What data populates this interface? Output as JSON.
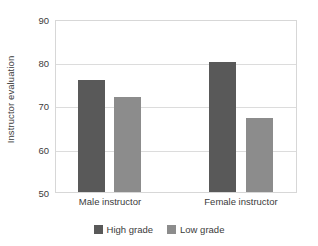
{
  "chart_data": {
    "type": "bar",
    "title": "",
    "xlabel": "",
    "ylabel": "Instructor evaluation",
    "categories": [
      "Male instructor",
      "Female instructor"
    ],
    "series": [
      {
        "name": "High grade",
        "values": [
          76,
          80
        ],
        "color": "#595959"
      },
      {
        "name": "Low grade",
        "values": [
          72,
          67
        ],
        "color": "#8c8c8c"
      }
    ],
    "ylim": [
      50,
      90
    ],
    "yticks": [
      50,
      60,
      70,
      80,
      90
    ],
    "ytick_labels": [
      "50",
      "60",
      "70",
      "80",
      "90"
    ],
    "grid": true,
    "legend_position": "bottom"
  },
  "axis": {
    "y_title": "Instructor evaluation",
    "tick_90": "90",
    "tick_80": "80",
    "tick_70": "70",
    "tick_60": "60",
    "tick_50": "50"
  },
  "categories": {
    "male": "Male instructor",
    "female": "Female instructor"
  },
  "legend": {
    "high": "High grade",
    "low": "Low grade"
  }
}
